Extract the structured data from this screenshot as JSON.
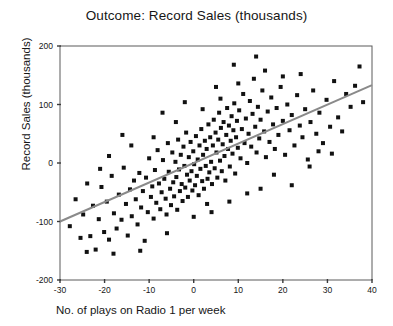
{
  "chart_data": {
    "type": "scatter",
    "title": "Outcome: Record Sales (thousands)",
    "xlabel": "No. of plays on Radio 1 per week",
    "ylabel": "Record Sales (thousands)",
    "xlim": [
      -30,
      40
    ],
    "ylim": [
      -200,
      200
    ],
    "xticks": [
      -30,
      -20,
      -10,
      0,
      10,
      20,
      30,
      40
    ],
    "yticks": [
      -200,
      -100,
      0,
      100,
      200
    ],
    "xtick_labels": [
      "-30",
      "-20",
      "-10",
      "0",
      "10",
      "20",
      "30",
      "40"
    ],
    "ytick_labels": [
      "-200",
      "-100",
      "0",
      "100",
      "200"
    ],
    "grid": false,
    "legend": null,
    "marker": "square",
    "marker_color": "#111111",
    "marker_size": 4,
    "fit_line": {
      "type": "linear-regression",
      "color": "#8a8a8a",
      "width": 2,
      "x_start": -30,
      "y_start": -100,
      "x_end": 40,
      "y_end": 133,
      "slope": 3.33,
      "intercept": 0
    },
    "points": [
      [
        -27.8,
        -108
      ],
      [
        -26.5,
        -62
      ],
      [
        -25.4,
        -128
      ],
      [
        -24.8,
        -88
      ],
      [
        -23.9,
        -35
      ],
      [
        -23.2,
        -125
      ],
      [
        -22.6,
        -73
      ],
      [
        -22.0,
        -148
      ],
      [
        -21.3,
        -96
      ],
      [
        -20.7,
        -41
      ],
      [
        -20.1,
        -118
      ],
      [
        -19.5,
        -66
      ],
      [
        -19.0,
        -131
      ],
      [
        -18.4,
        -22
      ],
      [
        -17.9,
        -86
      ],
      [
        -17.3,
        -112
      ],
      [
        -16.8,
        -54
      ],
      [
        -16.2,
        -97
      ],
      [
        -15.7,
        -8
      ],
      [
        -15.2,
        -70
      ],
      [
        -14.8,
        -124
      ],
      [
        -14.3,
        -45
      ],
      [
        -13.9,
        -91
      ],
      [
        -13.4,
        -30
      ],
      [
        -13.0,
        -62
      ],
      [
        -12.6,
        -105
      ],
      [
        -12.2,
        -17
      ],
      [
        -11.8,
        -76
      ],
      [
        -11.4,
        -48
      ],
      [
        -11.0,
        -133
      ],
      [
        -10.7,
        -25
      ],
      [
        -10.3,
        -84
      ],
      [
        -10.0,
        8
      ],
      [
        -9.6,
        -58
      ],
      [
        -9.3,
        -40
      ],
      [
        -9.0,
        -95
      ],
      [
        -8.7,
        -12
      ],
      [
        -8.4,
        -68
      ],
      [
        -8.1,
        22
      ],
      [
        -7.8,
        -35
      ],
      [
        -7.5,
        -79
      ],
      [
        -7.2,
        -50
      ],
      [
        -6.9,
        5
      ],
      [
        -6.6,
        -27
      ],
      [
        -6.3,
        -61
      ],
      [
        -6.1,
        -88
      ],
      [
        -5.8,
        34
      ],
      [
        -5.6,
        -15
      ],
      [
        -5.3,
        -44
      ],
      [
        -5.1,
        -72
      ],
      [
        -4.8,
        18
      ],
      [
        -4.6,
        -33
      ],
      [
        -4.4,
        -57
      ],
      [
        -4.1,
        2
      ],
      [
        -3.9,
        -24
      ],
      [
        -3.7,
        -80
      ],
      [
        -3.5,
        40
      ],
      [
        -3.3,
        -11
      ],
      [
        -3.1,
        -48
      ],
      [
        -2.9,
        14
      ],
      [
        -2.7,
        -36
      ],
      [
        -2.5,
        -65
      ],
      [
        -2.3,
        28
      ],
      [
        -2.1,
        -5
      ],
      [
        -1.9,
        -42
      ],
      [
        -1.7,
        52
      ],
      [
        -1.5,
        -20
      ],
      [
        -1.3,
        -58
      ],
      [
        -1.1,
        10
      ],
      [
        -0.9,
        -30
      ],
      [
        -0.7,
        36
      ],
      [
        -0.5,
        -14
      ],
      [
        -0.3,
        -47
      ],
      [
        -0.1,
        20
      ],
      [
        0.1,
        -2
      ],
      [
        0.3,
        -38
      ],
      [
        0.5,
        46
      ],
      [
        0.7,
        -22
      ],
      [
        0.9,
        6
      ],
      [
        1.1,
        -55
      ],
      [
        1.3,
        30
      ],
      [
        1.5,
        -10
      ],
      [
        1.7,
        58
      ],
      [
        1.9,
        -31
      ],
      [
        2.1,
        14
      ],
      [
        2.3,
        -44
      ],
      [
        2.5,
        38
      ],
      [
        2.7,
        -5
      ],
      [
        2.9,
        24
      ],
      [
        3.1,
        -27
      ],
      [
        3.3,
        66
      ],
      [
        3.5,
        -16
      ],
      [
        3.7,
        44
      ],
      [
        3.9,
        2
      ],
      [
        4.1,
        -36
      ],
      [
        4.3,
        30
      ],
      [
        4.5,
        74
      ],
      [
        4.7,
        -9
      ],
      [
        4.9,
        52
      ],
      [
        5.1,
        18
      ],
      [
        5.3,
        -25
      ],
      [
        5.5,
        40
      ],
      [
        5.7,
        86
      ],
      [
        5.9,
        4
      ],
      [
        6.1,
        60
      ],
      [
        6.3,
        -14
      ],
      [
        6.5,
        32
      ],
      [
        6.7,
        70
      ],
      [
        6.9,
        12
      ],
      [
        7.1,
        -30
      ],
      [
        7.3,
        48
      ],
      [
        7.5,
        94
      ],
      [
        7.7,
        24
      ],
      [
        7.9,
        64
      ],
      [
        8.1,
        -6
      ],
      [
        8.3,
        38
      ],
      [
        8.5,
        80
      ],
      [
        8.7,
        16
      ],
      [
        8.9,
        56
      ],
      [
        9.1,
        102
      ],
      [
        9.3,
        -18
      ],
      [
        9.5,
        44
      ],
      [
        9.7,
        72
      ],
      [
        9.9,
        26
      ],
      [
        10.2,
        90
      ],
      [
        10.5,
        8
      ],
      [
        10.8,
        58
      ],
      [
        11.1,
        118
      ],
      [
        11.4,
        34
      ],
      [
        11.7,
        76
      ],
      [
        12.0,
        0
      ],
      [
        12.3,
        50
      ],
      [
        12.6,
        106
      ],
      [
        12.9,
        28
      ],
      [
        13.2,
        84
      ],
      [
        13.5,
        144
      ],
      [
        13.8,
        62
      ],
      [
        14.1,
        18
      ],
      [
        14.4,
        96
      ],
      [
        14.7,
        42
      ],
      [
        15.0,
        74
      ],
      [
        15.4,
        124
      ],
      [
        15.8,
        54
      ],
      [
        16.2,
        10
      ],
      [
        16.6,
        88
      ],
      [
        17.0,
        36
      ],
      [
        17.4,
        112
      ],
      [
        17.8,
        66
      ],
      [
        18.2,
        24
      ],
      [
        18.6,
        94
      ],
      [
        19.0,
        48
      ],
      [
        19.5,
        130
      ],
      [
        20.0,
        72
      ],
      [
        20.5,
        14
      ],
      [
        21.0,
        100
      ],
      [
        21.5,
        56
      ],
      [
        22.0,
        82
      ],
      [
        22.6,
        30
      ],
      [
        23.2,
        116
      ],
      [
        23.8,
        64
      ],
      [
        24.4,
        44
      ],
      [
        25.0,
        92
      ],
      [
        25.6,
        6
      ],
      [
        26.2,
        70
      ],
      [
        26.8,
        124
      ],
      [
        27.5,
        50
      ],
      [
        28.2,
        86
      ],
      [
        29.0,
        34
      ],
      [
        29.8,
        108
      ],
      [
        30.6,
        62
      ],
      [
        31.5,
        140
      ],
      [
        32.4,
        78
      ],
      [
        33.3,
        54
      ],
      [
        34.2,
        118
      ],
      [
        35.2,
        96
      ],
      [
        36.2,
        132
      ],
      [
        37.2,
        165
      ],
      [
        38.0,
        104
      ],
      [
        -24.0,
        -152
      ],
      [
        -18.0,
        -155
      ],
      [
        -12.0,
        -150
      ],
      [
        -6.0,
        -120
      ],
      [
        0.0,
        -92
      ],
      [
        4.0,
        -84
      ],
      [
        8.0,
        -66
      ],
      [
        12.0,
        -52
      ],
      [
        -9.0,
        44
      ],
      [
        -4.0,
        70
      ],
      [
        2.0,
        92
      ],
      [
        6.0,
        110
      ],
      [
        10.0,
        136
      ],
      [
        14.0,
        182
      ],
      [
        16.0,
        158
      ],
      [
        20.0,
        148
      ],
      [
        24.0,
        152
      ],
      [
        9.0,
        168
      ],
      [
        5.0,
        130
      ],
      [
        -2.0,
        104
      ],
      [
        -7.0,
        86
      ],
      [
        -14.0,
        30
      ],
      [
        -19.0,
        12
      ],
      [
        -21.0,
        -10
      ],
      [
        18.0,
        -20
      ],
      [
        22.0,
        -38
      ],
      [
        15.0,
        -44
      ],
      [
        26.0,
        -6
      ],
      [
        28.0,
        20
      ],
      [
        31.0,
        16
      ],
      [
        3.0,
        -70
      ],
      [
        -16.0,
        48
      ]
    ]
  }
}
